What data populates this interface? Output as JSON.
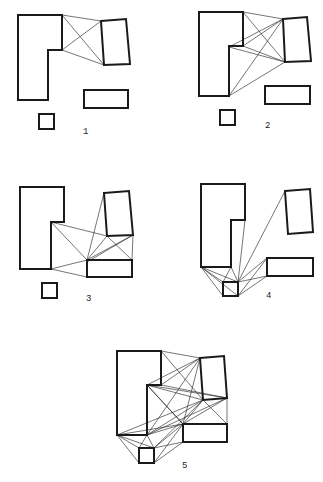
{
  "diagrams": [
    {
      "label": "1"
    },
    {
      "label": "2"
    },
    {
      "label": "3"
    },
    {
      "label": "4"
    },
    {
      "label": "5"
    }
  ],
  "colors": {
    "stroke": "#1a1a1a",
    "background": "#ffffff"
  }
}
